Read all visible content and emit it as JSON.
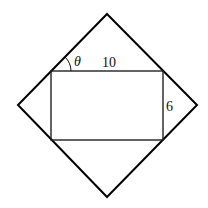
{
  "diagram": {
    "square": {
      "top": [
        107,
        14
      ],
      "right": [
        197,
        105
      ],
      "bottom": [
        107,
        197
      ],
      "left": [
        18,
        105
      ],
      "stroke": "#000000"
    },
    "rectangle": {
      "x": 51,
      "y": 71,
      "width": 112,
      "height": 69,
      "stroke": "#222222"
    },
    "labels": {
      "angle": "θ",
      "top_side": "10",
      "right_side": "6"
    }
  }
}
